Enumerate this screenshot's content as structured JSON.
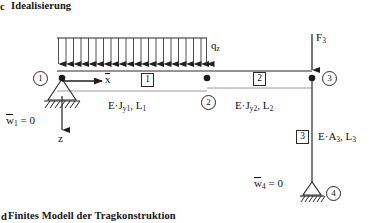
{
  "figure": {
    "top_caption": "Idealisierung",
    "top_caption_marker": "c",
    "bottom_caption": "Finites Modell der Tragkonstruktion",
    "bottom_caption_marker": "d",
    "type": "structural-frame-diagram"
  },
  "loads": {
    "distributed": {
      "label": "q",
      "label_sub": "z",
      "arrow_count": 21,
      "direction": "down",
      "span_from_node": "1",
      "span_to_node": "2"
    },
    "point": {
      "label": "F",
      "label_sub": "3",
      "direction": "down",
      "at_node": "3"
    }
  },
  "axes": {
    "x": {
      "label": "x",
      "overline": true,
      "direction": "right"
    },
    "z": {
      "label": "z",
      "direction": "down"
    }
  },
  "nodes": [
    {
      "id": "1",
      "label": "1"
    },
    {
      "id": "2",
      "label": "2"
    },
    {
      "id": "3",
      "label": "3"
    },
    {
      "id": "4",
      "label": "4"
    }
  ],
  "elements": [
    {
      "id": "1",
      "box_label": "1",
      "property": "E",
      "dot": "·",
      "stiffness": "J",
      "stiffness_sub": "y1",
      "comma": ",",
      "length": "L",
      "length_sub": "1"
    },
    {
      "id": "2",
      "box_label": "2",
      "property": "E",
      "dot": "·",
      "stiffness": "J",
      "stiffness_sub": "y2",
      "comma": ",",
      "length": "L",
      "length_sub": "2"
    },
    {
      "id": "3",
      "box_label": "3",
      "property": "E",
      "dot": "·",
      "stiffness": "A",
      "stiffness_sub": "3",
      "comma": ",",
      "length": "L",
      "length_sub": "3"
    }
  ],
  "boundary_conditions": [
    {
      "id": "bc-1",
      "symbol": "w",
      "overline": true,
      "sub": "1",
      "equals": "= 0",
      "at_node": "1",
      "support_type": "pinned-hatched"
    },
    {
      "id": "bc-4",
      "symbol": "w",
      "overline": true,
      "sub": "4",
      "equals": "= 0",
      "at_node": "4",
      "support_type": "pinned-hatched"
    }
  ],
  "colors": {
    "line": "#2a2a2a",
    "text": "#111111",
    "background": "#ffffff"
  }
}
